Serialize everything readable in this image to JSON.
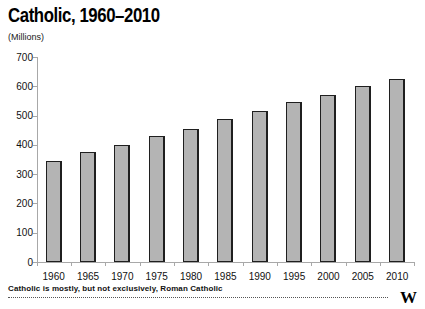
{
  "header": {
    "title": "Catholic, 1960–2010",
    "subtitle": "(Millions)"
  },
  "chart_data": {
    "type": "bar",
    "title": "Catholic, 1960–2010",
    "subtitle": "(Millions)",
    "ylabel": "Millions",
    "categories": [
      "1960",
      "1965",
      "1970",
      "1975",
      "1980",
      "1985",
      "1990",
      "1995",
      "2000",
      "2005",
      "2010"
    ],
    "values": [
      345,
      375,
      400,
      430,
      455,
      490,
      515,
      545,
      570,
      600,
      625
    ],
    "ylim": [
      0,
      700
    ],
    "yticks": [
      0,
      100,
      200,
      300,
      400,
      500,
      600,
      700
    ],
    "grid": false,
    "legend": "none",
    "bar_fill_color": "#b4b4b4",
    "bar_border_color": "#1f1f1f",
    "axis_color": "#a8a8a8"
  },
  "footer": {
    "note": "Catholic is mostly, but not exclusively, Roman Catholic",
    "logo": "W"
  }
}
